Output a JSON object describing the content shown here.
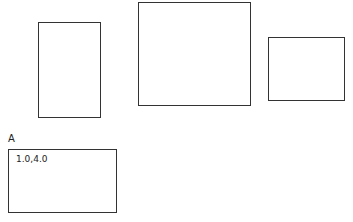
{
  "shapes": [
    {
      "name": "rect-left",
      "x": 38,
      "y": 22,
      "w": 63,
      "h": 96
    },
    {
      "name": "rect-middle",
      "x": 138,
      "y": 2,
      "w": 113,
      "h": 104
    },
    {
      "name": "rect-right",
      "x": 268,
      "y": 37,
      "w": 77,
      "h": 64
    },
    {
      "name": "rect-a",
      "x": 8,
      "y": 149,
      "w": 109,
      "h": 64
    }
  ],
  "selection": {
    "label": "A",
    "coordinates": "1.0,4.0"
  },
  "colors": {
    "stroke": "#333333",
    "background": "#ffffff"
  }
}
